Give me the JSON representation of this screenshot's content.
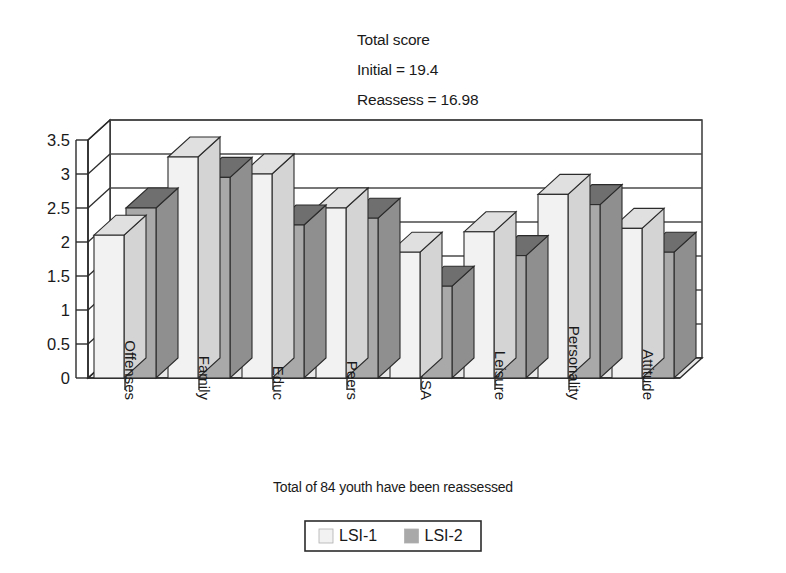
{
  "figure": {
    "title_lines": [
      "Total score",
      "Initial = 19.4",
      "Reassess = 16.98"
    ],
    "caption": "Total of  84 youth have been reassessed"
  },
  "legend": {
    "entries": [
      {
        "label": "LSI-1",
        "swatch": "#f2f2f2"
      },
      {
        "label": "LSI-2",
        "swatch": "#a9a9a9"
      }
    ]
  },
  "colors": {
    "lsi1_face": "#f2f2f2",
    "lsi1_top": "#e0e0e0",
    "lsi1_side": "#d4d4d4",
    "lsi2_face": "#a9a9a9",
    "lsi2_top": "#6f6f6f",
    "lsi2_side": "#8f8f8f",
    "floor": "#e8e8e8",
    "wall": "#ffffff",
    "outline": "#2b2b2b",
    "grid": "#4a4a4a",
    "text": "#1a1a1a"
  },
  "chart_data": {
    "type": "bar",
    "xlabel": "Total of  84 youth have been reassessed",
    "ylabel": "",
    "ylim": [
      0,
      3.5
    ],
    "ytick_step": 0.5,
    "yticks": [
      "0",
      "0.5",
      "1",
      "1.5",
      "2",
      "2.5",
      "3",
      "3.5"
    ],
    "grid": true,
    "legend_position": "bottom",
    "projection": "3d-column",
    "categories": [
      "Offenses",
      "Family",
      "Educ",
      "Peers",
      "SA",
      "Leisure",
      "Personality",
      "Attitude"
    ],
    "series": [
      {
        "name": "LSI-1",
        "values": [
          2.1,
          3.25,
          3.0,
          2.5,
          1.85,
          2.15,
          2.7,
          2.2
        ]
      },
      {
        "name": "LSI-2",
        "values": [
          2.5,
          2.95,
          2.25,
          2.35,
          1.35,
          1.8,
          2.55,
          1.85
        ]
      }
    ],
    "totals": {
      "initial": 19.4,
      "reassess": 16.98,
      "n_youth": 84
    }
  }
}
